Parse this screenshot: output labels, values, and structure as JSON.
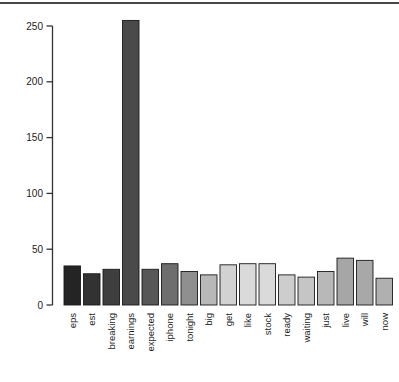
{
  "figure": {
    "background": "#ffffff",
    "top_rule_color": "#474747"
  },
  "chart_data": {
    "type": "bar",
    "title": "",
    "xlabel": "",
    "ylabel": "",
    "categories": [
      "eps",
      "est",
      "breaking",
      "earnings",
      "expected",
      "iphone",
      "tonight",
      "big",
      "get",
      "like",
      "stock",
      "ready",
      "waiting",
      "just",
      "live",
      "will",
      "now"
    ],
    "values": [
      35,
      28,
      32,
      255,
      32,
      37,
      30,
      27,
      36,
      37,
      37,
      27,
      25,
      30,
      42,
      40,
      24
    ],
    "bar_colors": [
      "#242424",
      "#323232",
      "#3e3e3e",
      "#4a4a4a",
      "#575757",
      "#6e6e6e",
      "#8f8f8f",
      "#b8b8b8",
      "#d2d2d2",
      "#dadada",
      "#dadada",
      "#cdcdcd",
      "#c5c5c5",
      "#b8b8b8",
      "#a6a6a6",
      "#a8a8a8",
      "#b0b0b0"
    ],
    "bar_border_color": "#1a1a1a",
    "ylim": [
      0,
      250
    ],
    "yticks": [
      0,
      50,
      100,
      150,
      200,
      250
    ],
    "ytick_labels": [
      "0",
      "50",
      "100",
      "150",
      "200",
      "250"
    ],
    "axis_color": "#333333",
    "tick_label_color": "#1f1f1f",
    "grid": false,
    "legend": null,
    "x_label_rotation": -90
  }
}
